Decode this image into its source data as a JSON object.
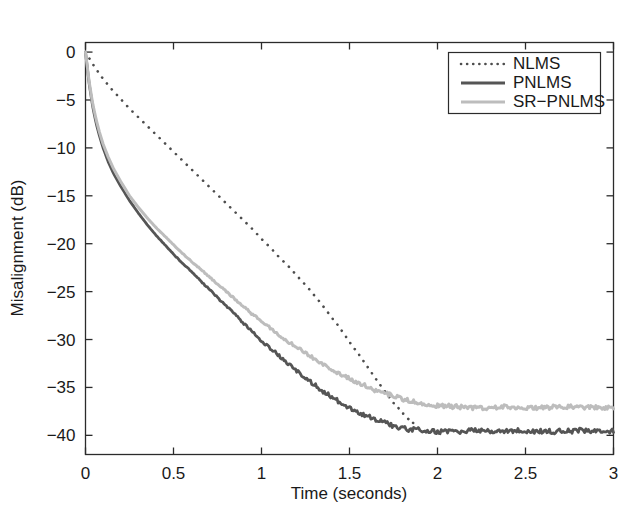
{
  "chart_data": {
    "type": "line",
    "title": "",
    "xlabel": "Time (seconds)",
    "ylabel": "Misalignment (dB)",
    "xlim": [
      0,
      3
    ],
    "ylim": [
      -42,
      1
    ],
    "grid": false,
    "legend_position": "top-right",
    "xticks": [
      0,
      0.5,
      1,
      1.5,
      2,
      2.5,
      3
    ],
    "xtick_labels": [
      "0",
      "0.5",
      "1",
      "1.5",
      "2",
      "2.5",
      "3"
    ],
    "yticks": [
      0,
      -5,
      -10,
      -15,
      -20,
      -25,
      -30,
      -35,
      -40
    ],
    "ytick_labels": [
      "0",
      "-5",
      "-10",
      "-15",
      "-20",
      "-25",
      "-30",
      "-35",
      "-40"
    ],
    "series": [
      {
        "name": "NLMS",
        "color": "#4d4d4d",
        "style": "dotted",
        "width": 2.6,
        "x": [
          0.0,
          0.05,
          0.1,
          0.15,
          0.2,
          0.25,
          0.3,
          0.35,
          0.4,
          0.45,
          0.5,
          0.55,
          0.6,
          0.65,
          0.7,
          0.75,
          0.8,
          0.85,
          0.9,
          0.95,
          1.0,
          1.05,
          1.1,
          1.15,
          1.2,
          1.25,
          1.3,
          1.35,
          1.4,
          1.45,
          1.5,
          1.55,
          1.6,
          1.65,
          1.7,
          1.75,
          1.8,
          1.85,
          1.9,
          1.95
        ],
        "y": [
          0.0,
          -1.5,
          -2.8,
          -3.9,
          -4.9,
          -5.9,
          -6.8,
          -7.7,
          -8.6,
          -9.5,
          -10.4,
          -11.3,
          -12.2,
          -13.1,
          -14.0,
          -14.9,
          -15.8,
          -16.7,
          -17.6,
          -18.5,
          -19.5,
          -20.4,
          -21.4,
          -22.3,
          -23.3,
          -24.3,
          -25.4,
          -26.5,
          -27.7,
          -28.9,
          -30.2,
          -31.5,
          -32.8,
          -34.1,
          -35.4,
          -36.6,
          -37.7,
          -38.6,
          -39.3,
          -39.9
        ]
      },
      {
        "name": "PNLMS",
        "color": "#555555",
        "style": "solid",
        "width": 2.8,
        "x": [
          0.0,
          0.02,
          0.04,
          0.06,
          0.08,
          0.1,
          0.13,
          0.16,
          0.2,
          0.25,
          0.3,
          0.35,
          0.4,
          0.45,
          0.5,
          0.55,
          0.6,
          0.65,
          0.7,
          0.75,
          0.8,
          0.85,
          0.9,
          0.95,
          1.0,
          1.05,
          1.1,
          1.15,
          1.2,
          1.25,
          1.3,
          1.35,
          1.4,
          1.45,
          1.5,
          1.55,
          1.6,
          1.65,
          1.7,
          1.75,
          1.8,
          1.85,
          1.9,
          1.95,
          2.0,
          2.1,
          2.2,
          2.3,
          2.4,
          2.5,
          2.6,
          2.7,
          2.8,
          2.9,
          3.0
        ],
        "y": [
          0.0,
          -3.2,
          -5.6,
          -7.4,
          -8.8,
          -10.0,
          -11.5,
          -12.7,
          -14.0,
          -15.5,
          -16.8,
          -18.0,
          -19.1,
          -20.1,
          -21.1,
          -22.0,
          -22.9,
          -23.8,
          -24.7,
          -25.6,
          -26.5,
          -27.4,
          -28.3,
          -29.2,
          -30.1,
          -30.9,
          -31.7,
          -32.5,
          -33.3,
          -34.0,
          -34.7,
          -35.4,
          -36.0,
          -36.6,
          -37.1,
          -37.6,
          -38.0,
          -38.4,
          -38.7,
          -39.0,
          -39.2,
          -39.4,
          -39.5,
          -39.6,
          -39.6,
          -39.6,
          -39.5,
          -39.6,
          -39.6,
          -39.5,
          -39.6,
          -39.6,
          -39.5,
          -39.6,
          -39.6
        ]
      },
      {
        "name": "SR-PNLMS",
        "color": "#bdbdbd",
        "style": "solid",
        "width": 3.0,
        "x": [
          0.0,
          0.02,
          0.04,
          0.06,
          0.08,
          0.1,
          0.13,
          0.16,
          0.2,
          0.25,
          0.3,
          0.35,
          0.4,
          0.45,
          0.5,
          0.55,
          0.6,
          0.65,
          0.7,
          0.75,
          0.8,
          0.85,
          0.9,
          0.95,
          1.0,
          1.05,
          1.1,
          1.15,
          1.2,
          1.25,
          1.3,
          1.35,
          1.4,
          1.45,
          1.5,
          1.55,
          1.6,
          1.65,
          1.7,
          1.75,
          1.8,
          1.85,
          1.9,
          1.95,
          2.0,
          2.1,
          2.2,
          2.3,
          2.4,
          2.5,
          2.6,
          2.7,
          2.8,
          2.9,
          3.0
        ],
        "y": [
          0.0,
          -3.0,
          -5.3,
          -7.0,
          -8.4,
          -9.6,
          -11.0,
          -12.2,
          -13.5,
          -15.0,
          -16.2,
          -17.3,
          -18.3,
          -19.2,
          -20.1,
          -21.0,
          -21.8,
          -22.6,
          -23.4,
          -24.2,
          -25.0,
          -25.8,
          -26.6,
          -27.4,
          -28.1,
          -28.8,
          -29.5,
          -30.2,
          -30.8,
          -31.4,
          -32.0,
          -32.6,
          -33.1,
          -33.6,
          -34.1,
          -34.5,
          -34.9,
          -35.3,
          -35.6,
          -35.9,
          -36.2,
          -36.4,
          -36.6,
          -36.8,
          -36.9,
          -37.0,
          -37.1,
          -37.1,
          -37.0,
          -37.1,
          -37.1,
          -37.0,
          -37.1,
          -37.1,
          -37.1
        ]
      }
    ]
  },
  "legend": {
    "entries": [
      {
        "label": "NLMS"
      },
      {
        "label": "PNLMS"
      },
      {
        "label": "SR-PNLMS"
      }
    ]
  },
  "colors": {
    "background": "#ffffff",
    "axis": "#2b2b2b",
    "nlms": "#4d4d4d",
    "pnlms": "#555555",
    "srpnlms": "#bdbdbd"
  }
}
